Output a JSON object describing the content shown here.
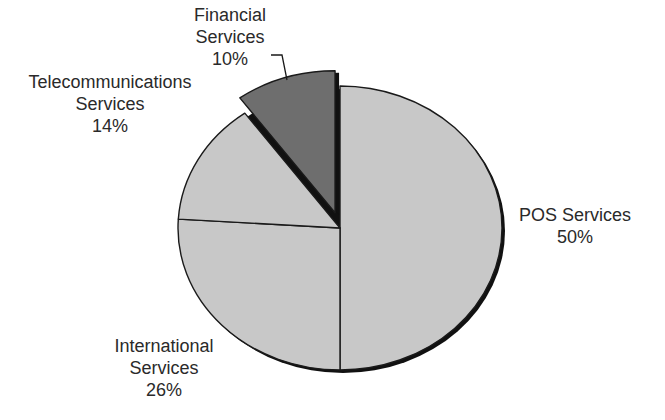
{
  "chart_data": {
    "type": "pie",
    "title": "",
    "categories": [
      "POS Services",
      "International Services",
      "Telecommunications Services",
      "Financial Services"
    ],
    "values": [
      50,
      26,
      14,
      10
    ],
    "unit": "%",
    "exploded": [
      "Financial Services"
    ],
    "colors": [
      "#c8c8c8",
      "#c8c8c8",
      "#c8c8c8",
      "#6e6e6e"
    ],
    "legend": "none (direct labels)",
    "labels": [
      {
        "lines": [
          "POS Services"
        ],
        "value": "50%"
      },
      {
        "lines": [
          "International",
          "Services"
        ],
        "value": "26%"
      },
      {
        "lines": [
          "Telecommunications",
          "Services"
        ],
        "value": "14%"
      },
      {
        "lines": [
          "Financial",
          "Services"
        ],
        "value": "10%"
      }
    ]
  },
  "style": {
    "slice_light": "#c8c8c8",
    "slice_dark": "#6e6e6e",
    "outline": "#1a1a1a",
    "shadow": "#111111"
  }
}
